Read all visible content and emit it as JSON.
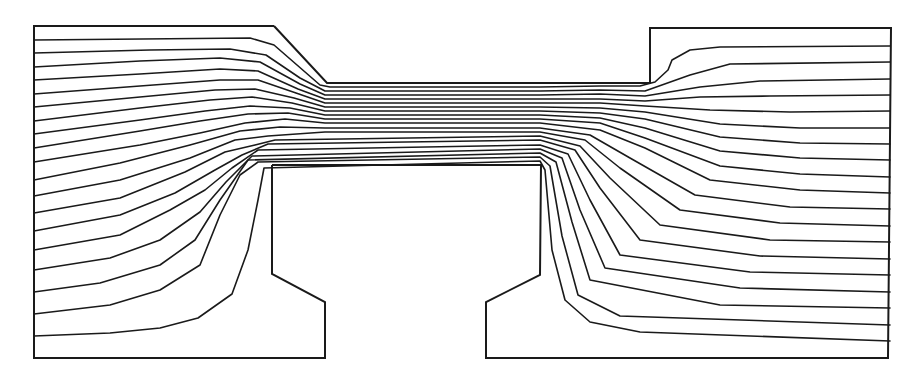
{
  "figure": {
    "type": "streamline-flow-diagram",
    "stroke_color": "#1a1a1a",
    "background": "#ffffff",
    "streamline_count": 19
  },
  "boundaries": {
    "left_chamber": [
      [
        274,
        26
      ],
      [
        34,
        26
      ],
      [
        34,
        358
      ],
      [
        325,
        358
      ],
      [
        325,
        302
      ],
      [
        272,
        274
      ],
      [
        272,
        165
      ]
    ],
    "channel_top": [
      [
        274,
        26
      ],
      [
        327,
        83
      ],
      [
        650,
        83
      ],
      [
        650,
        28
      ],
      [
        891,
        28
      ],
      [
        888,
        358
      ],
      [
        486,
        358
      ],
      [
        486,
        302
      ],
      [
        540,
        275
      ],
      [
        541,
        165
      ],
      [
        272,
        165
      ]
    ]
  },
  "streamlines": [
    {
      "id": 0,
      "points": [
        [
          34,
          40
        ],
        [
          250,
          38
        ],
        [
          274,
          45
        ],
        [
          320,
          85
        ],
        [
          330,
          87
        ],
        [
          540,
          87
        ],
        [
          600,
          86
        ],
        [
          640,
          86
        ],
        [
          655,
          82
        ],
        [
          668,
          70
        ],
        [
          672,
          60
        ],
        [
          690,
          50
        ],
        [
          720,
          47
        ],
        [
          890,
          46
        ]
      ]
    },
    {
      "id": 1,
      "points": [
        [
          34,
          53
        ],
        [
          150,
          50
        ],
        [
          230,
          49
        ],
        [
          266,
          55
        ],
        [
          300,
          78
        ],
        [
          325,
          91
        ],
        [
          540,
          91
        ],
        [
          600,
          90
        ],
        [
          645,
          91
        ],
        [
          690,
          75
        ],
        [
          730,
          64
        ],
        [
          890,
          62
        ]
      ]
    },
    {
      "id": 2,
      "points": [
        [
          34,
          67
        ],
        [
          140,
          61
        ],
        [
          220,
          58
        ],
        [
          260,
          62
        ],
        [
          300,
          84
        ],
        [
          325,
          95
        ],
        [
          540,
          95
        ],
        [
          600,
          94
        ],
        [
          645,
          96
        ],
        [
          700,
          87
        ],
        [
          760,
          81
        ],
        [
          890,
          79
        ]
      ]
    },
    {
      "id": 3,
      "points": [
        [
          34,
          80
        ],
        [
          140,
          74
        ],
        [
          220,
          69
        ],
        [
          258,
          71
        ],
        [
          298,
          89
        ],
        [
          325,
          99
        ],
        [
          540,
          99
        ],
        [
          600,
          99
        ],
        [
          645,
          101
        ],
        [
          700,
          97
        ],
        [
          770,
          96
        ],
        [
          890,
          95
        ]
      ]
    },
    {
      "id": 4,
      "points": [
        [
          34,
          94
        ],
        [
          140,
          86
        ],
        [
          220,
          80
        ],
        [
          258,
          80
        ],
        [
          296,
          93
        ],
        [
          325,
          103
        ],
        [
          540,
          103
        ],
        [
          600,
          103
        ],
        [
          645,
          106
        ],
        [
          710,
          110
        ],
        [
          790,
          112
        ],
        [
          890,
          111
        ]
      ]
    },
    {
      "id": 5,
      "points": [
        [
          34,
          107
        ],
        [
          140,
          97
        ],
        [
          215,
          90
        ],
        [
          255,
          89
        ],
        [
          294,
          98
        ],
        [
          325,
          107
        ],
        [
          540,
          107
        ],
        [
          600,
          108
        ],
        [
          645,
          112
        ],
        [
          720,
          124
        ],
        [
          800,
          128
        ],
        [
          890,
          128
        ]
      ]
    },
    {
      "id": 6,
      "points": [
        [
          34,
          121
        ],
        [
          140,
          108
        ],
        [
          210,
          100
        ],
        [
          252,
          97
        ],
        [
          292,
          103
        ],
        [
          325,
          111
        ],
        [
          540,
          111
        ],
        [
          600,
          113
        ],
        [
          645,
          119
        ],
        [
          720,
          137
        ],
        [
          800,
          143
        ],
        [
          890,
          144
        ]
      ]
    },
    {
      "id": 7,
      "points": [
        [
          34,
          134
        ],
        [
          140,
          120
        ],
        [
          205,
          111
        ],
        [
          250,
          106
        ],
        [
          290,
          108
        ],
        [
          325,
          115
        ],
        [
          540,
          115
        ],
        [
          600,
          118
        ],
        [
          645,
          128
        ],
        [
          720,
          151
        ],
        [
          800,
          158
        ],
        [
          890,
          160
        ]
      ]
    },
    {
      "id": 8,
      "points": [
        [
          34,
          148
        ],
        [
          140,
          131
        ],
        [
          200,
          121
        ],
        [
          248,
          114
        ],
        [
          288,
          113
        ],
        [
          325,
          119
        ],
        [
          540,
          119
        ],
        [
          600,
          123
        ],
        [
          645,
          138
        ],
        [
          720,
          166
        ],
        [
          800,
          174
        ],
        [
          890,
          177
        ]
      ]
    },
    {
      "id": 9,
      "points": [
        [
          34,
          162
        ],
        [
          140,
          145
        ],
        [
          200,
          133
        ],
        [
          245,
          123
        ],
        [
          285,
          119
        ],
        [
          325,
          123
        ],
        [
          540,
          123
        ],
        [
          600,
          130
        ],
        [
          645,
          148
        ],
        [
          710,
          180
        ],
        [
          800,
          190
        ],
        [
          890,
          193
        ]
      ]
    },
    {
      "id": 10,
      "points": [
        [
          34,
          180
        ],
        [
          120,
          163
        ],
        [
          190,
          145
        ],
        [
          240,
          131
        ],
        [
          280,
          127
        ],
        [
          325,
          128
        ],
        [
          540,
          128
        ],
        [
          590,
          135
        ],
        [
          630,
          158
        ],
        [
          695,
          195
        ],
        [
          790,
          207
        ],
        [
          890,
          209
        ]
      ]
    },
    {
      "id": 11,
      "points": [
        [
          34,
          196
        ],
        [
          120,
          180
        ],
        [
          190,
          158
        ],
        [
          235,
          140
        ],
        [
          268,
          136
        ],
        [
          325,
          132
        ],
        [
          540,
          132
        ],
        [
          585,
          140
        ],
        [
          620,
          168
        ],
        [
          680,
          210
        ],
        [
          780,
          223
        ],
        [
          890,
          226
        ]
      ]
    },
    {
      "id": 12,
      "points": [
        [
          34,
          213
        ],
        [
          120,
          198
        ],
        [
          185,
          172
        ],
        [
          225,
          152
        ],
        [
          255,
          145
        ],
        [
          275,
          140
        ],
        [
          540,
          136
        ],
        [
          580,
          146
        ],
        [
          610,
          178
        ],
        [
          660,
          225
        ],
        [
          770,
          240
        ],
        [
          890,
          242
        ]
      ]
    },
    {
      "id": 13,
      "points": [
        [
          34,
          231
        ],
        [
          120,
          215
        ],
        [
          175,
          193
        ],
        [
          215,
          170
        ],
        [
          242,
          155
        ],
        [
          268,
          144
        ],
        [
          540,
          140
        ],
        [
          575,
          150
        ],
        [
          600,
          188
        ],
        [
          640,
          240
        ],
        [
          760,
          256
        ],
        [
          890,
          259
        ]
      ]
    },
    {
      "id": 14,
      "points": [
        [
          34,
          250
        ],
        [
          120,
          235
        ],
        [
          170,
          210
        ],
        [
          205,
          190
        ],
        [
          232,
          168
        ],
        [
          258,
          150
        ],
        [
          540,
          145
        ],
        [
          568,
          154
        ],
        [
          590,
          200
        ],
        [
          620,
          255
        ],
        [
          750,
          272
        ],
        [
          890,
          275
        ]
      ]
    },
    {
      "id": 15,
      "points": [
        [
          34,
          270
        ],
        [
          110,
          258
        ],
        [
          160,
          240
        ],
        [
          200,
          212
        ],
        [
          226,
          182
        ],
        [
          252,
          156
        ],
        [
          540,
          149
        ],
        [
          562,
          158
        ],
        [
          580,
          210
        ],
        [
          605,
          268
        ],
        [
          740,
          288
        ],
        [
          890,
          292
        ]
      ]
    },
    {
      "id": 16,
      "points": [
        [
          34,
          292
        ],
        [
          100,
          283
        ],
        [
          160,
          265
        ],
        [
          195,
          240
        ],
        [
          220,
          200
        ],
        [
          248,
          160
        ],
        [
          540,
          153
        ],
        [
          556,
          162
        ],
        [
          572,
          222
        ],
        [
          590,
          280
        ],
        [
          720,
          305
        ],
        [
          890,
          308
        ]
      ]
    },
    {
      "id": 17,
      "points": [
        [
          34,
          314
        ],
        [
          110,
          305
        ],
        [
          160,
          290
        ],
        [
          200,
          265
        ],
        [
          220,
          215
        ],
        [
          240,
          175
        ],
        [
          258,
          162
        ],
        [
          540,
          157
        ],
        [
          550,
          166
        ],
        [
          562,
          236
        ],
        [
          578,
          295
        ],
        [
          620,
          316
        ],
        [
          890,
          325
        ]
      ]
    },
    {
      "id": 18,
      "points": [
        [
          34,
          336
        ],
        [
          110,
          333
        ],
        [
          160,
          328
        ],
        [
          198,
          318
        ],
        [
          232,
          294
        ],
        [
          248,
          250
        ],
        [
          258,
          200
        ],
        [
          264,
          168
        ],
        [
          540,
          161
        ],
        [
          545,
          170
        ],
        [
          552,
          250
        ],
        [
          565,
          300
        ],
        [
          590,
          322
        ],
        [
          640,
          332
        ],
        [
          890,
          341
        ]
      ]
    }
  ]
}
